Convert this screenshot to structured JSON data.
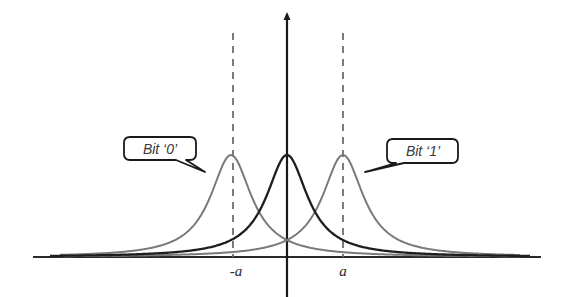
{
  "diagram": {
    "type": "probability-distributions",
    "labels": {
      "bit0": "Bit ‘0’",
      "bit1": "Bit ‘1’",
      "neg_a": "-a",
      "pos_a": "a"
    },
    "colors": {
      "axis": "#1a1a1a",
      "center_curve": "#1e1e1e",
      "side_curves": "#7a7a7a",
      "dashed_lines": "#6e6e6e",
      "callout_border": "#1a1a1a",
      "callout_text": "#4a4a4a"
    },
    "curves": [
      {
        "name": "bit-0-distribution",
        "center": -1,
        "shape": "lorentzian",
        "color": "#7a7a7a"
      },
      {
        "name": "center-distribution",
        "center": 0,
        "shape": "lorentzian",
        "color": "#1e1e1e"
      },
      {
        "name": "bit-1-distribution",
        "center": 1,
        "shape": "lorentzian",
        "color": "#7a7a7a"
      }
    ],
    "markers": [
      {
        "name": "neg-a-threshold",
        "x": -1,
        "label": "-a",
        "style": "dashed"
      },
      {
        "name": "pos-a-threshold",
        "x": 1,
        "label": "a",
        "style": "dashed"
      }
    ]
  }
}
